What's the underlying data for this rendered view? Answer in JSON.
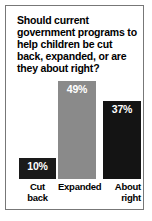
{
  "chart_data": {
    "type": "bar",
    "title": "Should current government programs to help children be cut back, expanded, or are they about right?",
    "xlabel": "",
    "ylabel": "",
    "ylim": [
      0,
      100
    ],
    "grid": false,
    "legend": false,
    "categories": [
      "Cut back",
      "Expanded",
      "About right"
    ],
    "values": [
      10,
      37,
      49
    ],
    "series": [
      {
        "name": "Share of respondents (%)",
        "points": [
          {
            "category": "Cut back",
            "label_line1": "Cut",
            "label_line2": "back",
            "value": 10,
            "value_label": "10%",
            "color": "#1a1a1a"
          },
          {
            "category": "Expanded",
            "label_line1": "Expanded",
            "label_line2": "",
            "value": 49,
            "value_label": "49%",
            "color": "#8a8a8a"
          },
          {
            "category": "About right",
            "label_line1": "About",
            "label_line2": "right",
            "value": 37,
            "value_label": "37%",
            "color": "#141414"
          }
        ]
      }
    ],
    "colors": {
      "bar_cut_back": "#1a1a1a",
      "bar_expanded": "#8a8a8a",
      "bar_about_right": "#141414",
      "value_label_text": "#ffffff",
      "category_label_text": "#000000",
      "title_text": "#000000",
      "frame_border": "#777777",
      "background": "#ffffff"
    }
  }
}
